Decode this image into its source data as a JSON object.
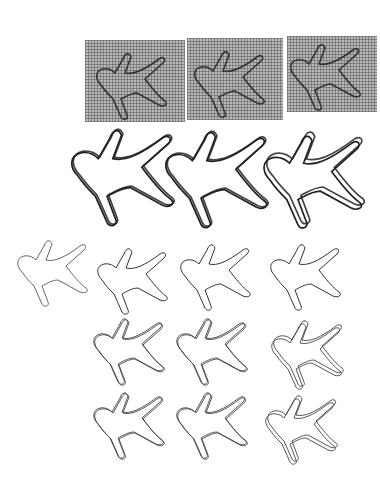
{
  "figure": {
    "rows": [
      {
        "name": "mesh-overlay-row",
        "count": 3,
        "style": "silhouette on gray deformation grid"
      },
      {
        "name": "swept-deformation-row",
        "count": 3,
        "style": "bold outline with hatched motion trails at limbs"
      },
      {
        "name": "outline-row-1",
        "count": 4,
        "style": "thin outlines, first is reference shape"
      },
      {
        "name": "outline-row-2",
        "count": 3,
        "style": "thin double outlines"
      },
      {
        "name": "outline-row-3",
        "count": 3,
        "style": "thin double outlines"
      }
    ],
    "colors": {
      "background": "#ffffff",
      "mesh": "#b9b9b9",
      "stroke": "#333333"
    }
  }
}
